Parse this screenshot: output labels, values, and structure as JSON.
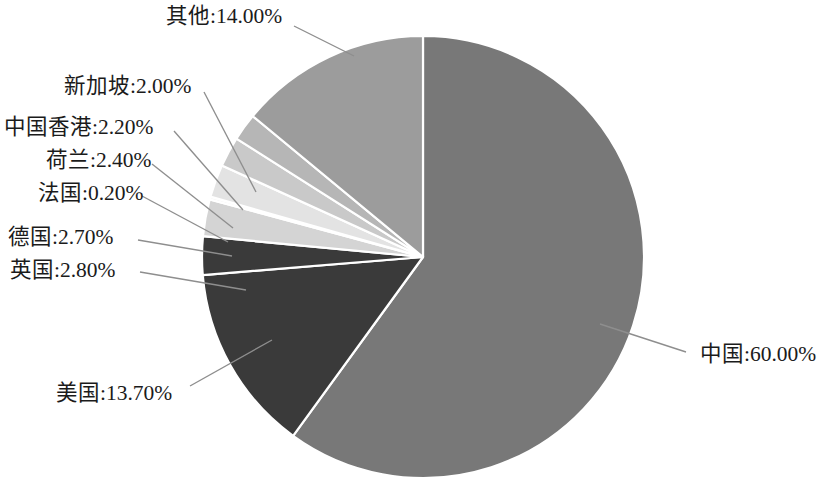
{
  "chart_data": {
    "type": "pie",
    "title": "",
    "subtitle": "",
    "xlabel": "",
    "ylabel": "",
    "legend_position": "none",
    "grid": false,
    "label_format": "{name}:{value}%",
    "start_angle_deg": 0,
    "direction": "clockwise",
    "categories": [
      "中国",
      "美国",
      "英国",
      "德国",
      "法国",
      "荷兰",
      "中国香港",
      "新加坡",
      "其他"
    ],
    "values": [
      60.0,
      13.7,
      2.8,
      2.7,
      0.2,
      2.4,
      2.2,
      2.0,
      14.0
    ],
    "value_labels": [
      "60.00%",
      "13.70%",
      "2.80%",
      "2.70%",
      "0.20%",
      "2.40%",
      "2.20%",
      "2.00%",
      "14.00%"
    ],
    "total": 100.0,
    "slices": [
      {
        "name": "中国",
        "value": 60.0,
        "value_label": "60.00%",
        "label_text": "中国:60.00%",
        "color": "#787878",
        "label_x": 700,
        "label_y": 344,
        "align": "left",
        "leader": "M 600 324 L 686 352"
      },
      {
        "name": "美国",
        "value": 13.7,
        "value_label": "13.70%",
        "label_text": "美国:13.70%",
        "color": "#3a3a3a",
        "label_x": 56,
        "label_y": 383,
        "align": "left",
        "leader": "M 272 340 L 190 386"
      },
      {
        "name": "英国",
        "value": 2.8,
        "value_label": "2.80%",
        "label_text": "英国:2.80%",
        "color": "#3a3a3a",
        "label_x": 10,
        "label_y": 260,
        "align": "left",
        "leader": "M 246 290 L 140 272"
      },
      {
        "name": "德国",
        "value": 2.7,
        "value_label": "2.70%",
        "label_text": "德国:2.70%",
        "color": "#d4d4d4",
        "label_x": 8,
        "label_y": 227,
        "align": "left",
        "leader": "M 232 256 L 138 240"
      },
      {
        "name": "法国",
        "value": 0.2,
        "value_label": "0.20%",
        "label_text": "法国:0.20%",
        "color": "#f2f2f2",
        "label_x": 38,
        "label_y": 183,
        "align": "left",
        "leader": "M 228 242 L 142 196"
      },
      {
        "name": "荷兰",
        "value": 2.4,
        "value_label": "2.40%",
        "label_text": "荷兰:2.40%",
        "color": "#e3e3e3",
        "label_x": 46,
        "label_y": 150,
        "align": "left",
        "leader": "M 233 228 L 152 164"
      },
      {
        "name": "中国香港",
        "value": 2.2,
        "value_label": "2.20%",
        "label_text": "中国香港:2.20%",
        "color": "#c9c9c9",
        "label_x": 4,
        "label_y": 117,
        "align": "left",
        "leader": "M 243 210 L 174 131"
      },
      {
        "name": "新加坡",
        "value": 2.0,
        "value_label": "2.00%",
        "label_text": "新加坡:2.00%",
        "color": "#b6b6b6",
        "label_x": 64,
        "label_y": 76,
        "align": "left",
        "leader": "M 256 192 L 204 92"
      },
      {
        "name": "其他",
        "value": 14.0,
        "value_label": "14.00%",
        "label_text": "其他:14.00%",
        "color": "#9c9c9c",
        "label_x": 166,
        "label_y": 6,
        "align": "left",
        "leader": "M 354 56 L 294 26"
      }
    ],
    "geometry": {
      "center_x": 423,
      "center_y": 257,
      "radius": 221
    },
    "style": {
      "background": "#ffffff",
      "slice_border": "#ffffff",
      "leader_color": "#8e8e8e",
      "text_color": "#1b1b1b"
    }
  }
}
